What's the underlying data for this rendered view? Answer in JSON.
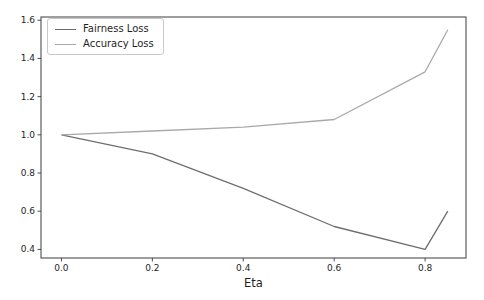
{
  "figure": {
    "background": "#ffffff"
  },
  "chart_data": {
    "type": "line",
    "title": "",
    "xlabel": "Eta",
    "ylabel": "",
    "x": [
      0.0,
      0.2,
      0.4,
      0.6,
      0.8,
      0.85
    ],
    "series": [
      {
        "name": "Fairness Loss",
        "color": "#6e6e6e",
        "values": [
          1.0,
          0.9,
          0.72,
          0.52,
          0.4,
          0.6
        ]
      },
      {
        "name": "Accuracy Loss",
        "color": "#a9a9a9",
        "values": [
          1.0,
          1.02,
          1.04,
          1.08,
          1.33,
          1.55
        ]
      }
    ],
    "xlim": [
      -0.045,
      0.89
    ],
    "ylim": [
      0.355,
      1.617
    ],
    "x_tick_labels": [
      "0.0",
      "0.2",
      "0.4",
      "0.6",
      "0.8"
    ],
    "x_tick_values": [
      0.0,
      0.2,
      0.4,
      0.6,
      0.8
    ],
    "y_tick_labels": [
      "0.4",
      "0.6",
      "0.8",
      "1.0",
      "1.2",
      "1.4",
      "1.6"
    ],
    "y_tick_values": [
      0.4,
      0.6,
      0.8,
      1.0,
      1.2,
      1.4,
      1.6
    ],
    "grid": false,
    "legend_position": "upper-left",
    "axis_color": "#3c3c3c",
    "tick_label_color": "#262626",
    "line_width": 1.3
  }
}
